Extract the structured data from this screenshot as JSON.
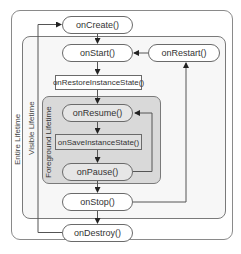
{
  "diagram": {
    "lifetimes": {
      "entire": "Entire Lifetime",
      "visible": "Visible Lifetime",
      "foreground": "Foreground Lifetime"
    },
    "nodes": {
      "on_create": "onCreate()",
      "on_start": "onStart()",
      "on_restart": "onRestart()",
      "on_restore_instance_state": "onRestoreInstanceState()",
      "on_resume": "onResume()",
      "on_save_instance_state": "onSaveInstanceState()",
      "on_pause": "onPause()",
      "on_stop": "onStop()",
      "on_destroy": "onDestroy()"
    },
    "edges": [
      {
        "from": "onCreate()",
        "to": "onStart()"
      },
      {
        "from": "onRestart()",
        "to": "onStart()"
      },
      {
        "from": "onStart()",
        "to": "onRestoreInstanceState()"
      },
      {
        "from": "onRestoreInstanceState()",
        "to": "onResume()"
      },
      {
        "from": "onResume()",
        "to": "onSaveInstanceState()"
      },
      {
        "from": "onSaveInstanceState()",
        "to": "onPause()"
      },
      {
        "from": "onPause()",
        "to": "onResume()"
      },
      {
        "from": "onPause()",
        "to": "onStop()"
      },
      {
        "from": "onStop()",
        "to": "onRestart()"
      },
      {
        "from": "onStop()",
        "to": "onDestroy()"
      },
      {
        "from": "onDestroy()",
        "to": "onCreate()"
      }
    ],
    "colors": {
      "border": "#6a6a6a",
      "foreground_fill": "#d9d9d9",
      "visible_fill": "#f7f7f7",
      "node_fill": "#ffffff"
    }
  }
}
